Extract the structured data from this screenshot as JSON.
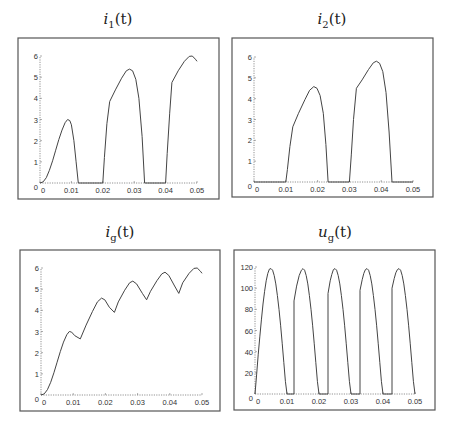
{
  "chart_data": [
    {
      "id": "i1",
      "type": "line",
      "title": "i1(t)",
      "title_base": "i",
      "title_sub": "1",
      "title_arg": "(t)",
      "xlabel": "",
      "ylabel": "",
      "xlim": [
        0,
        0.05
      ],
      "ylim": [
        0,
        6
      ],
      "xticks": [
        "0",
        "0.01",
        "0.02",
        "0.03",
        "0.04",
        "0.05"
      ],
      "yticks": [
        "0",
        "1",
        "2",
        "3",
        "4",
        "5",
        "6"
      ],
      "grid": false,
      "points": [
        [
          0,
          0
        ],
        [
          0.001,
          0.05
        ],
        [
          0.002,
          0.25
        ],
        [
          0.003,
          0.6
        ],
        [
          0.004,
          1.05
        ],
        [
          0.005,
          1.55
        ],
        [
          0.006,
          2.05
        ],
        [
          0.007,
          2.5
        ],
        [
          0.008,
          2.85
        ],
        [
          0.0088,
          3.0
        ],
        [
          0.0095,
          2.95
        ],
        [
          0.01,
          2.75
        ],
        [
          0.0108,
          2.0
        ],
        [
          0.0115,
          1.0
        ],
        [
          0.0122,
          0
        ],
        [
          0.02,
          0
        ],
        [
          0.0205,
          1.2
        ],
        [
          0.0213,
          2.8
        ],
        [
          0.0222,
          3.85
        ],
        [
          0.024,
          4.4
        ],
        [
          0.026,
          4.95
        ],
        [
          0.0275,
          5.3
        ],
        [
          0.0285,
          5.38
        ],
        [
          0.0295,
          5.3
        ],
        [
          0.0305,
          4.9
        ],
        [
          0.0315,
          4.0
        ],
        [
          0.0325,
          2.2
        ],
        [
          0.0333,
          0
        ],
        [
          0.04,
          0
        ],
        [
          0.0405,
          1.4
        ],
        [
          0.0413,
          3.3
        ],
        [
          0.042,
          4.75
        ],
        [
          0.044,
          5.3
        ],
        [
          0.046,
          5.75
        ],
        [
          0.0475,
          5.98
        ],
        [
          0.0485,
          6.0
        ],
        [
          0.0495,
          5.85
        ],
        [
          0.05,
          5.75
        ]
      ]
    },
    {
      "id": "i2",
      "type": "line",
      "title": "i2(t)",
      "title_base": "i",
      "title_sub": "2",
      "title_arg": "(t)",
      "xlabel": "",
      "ylabel": "",
      "xlim": [
        0,
        0.05
      ],
      "ylim": [
        0,
        6
      ],
      "xticks": [
        "0",
        "0.01",
        "0.02",
        "0.03",
        "0.04",
        "0.05"
      ],
      "yticks": [
        "0",
        "1",
        "2",
        "3",
        "4",
        "5",
        "6"
      ],
      "grid": false,
      "points": [
        [
          0,
          0
        ],
        [
          0.01,
          0
        ],
        [
          0.0105,
          0.6
        ],
        [
          0.0113,
          1.7
        ],
        [
          0.0122,
          2.65
        ],
        [
          0.014,
          3.3
        ],
        [
          0.016,
          3.95
        ],
        [
          0.0175,
          4.4
        ],
        [
          0.0188,
          4.58
        ],
        [
          0.0198,
          4.5
        ],
        [
          0.0208,
          4.15
        ],
        [
          0.0218,
          3.3
        ],
        [
          0.0226,
          1.8
        ],
        [
          0.0233,
          0
        ],
        [
          0.03,
          0
        ],
        [
          0.0306,
          1.3
        ],
        [
          0.0313,
          3.0
        ],
        [
          0.0322,
          4.5
        ],
        [
          0.034,
          4.9
        ],
        [
          0.036,
          5.4
        ],
        [
          0.0375,
          5.72
        ],
        [
          0.0385,
          5.8
        ],
        [
          0.0395,
          5.7
        ],
        [
          0.0405,
          5.3
        ],
        [
          0.0415,
          4.3
        ],
        [
          0.0425,
          2.4
        ],
        [
          0.0434,
          0
        ],
        [
          0.05,
          0
        ]
      ]
    },
    {
      "id": "ig",
      "type": "line",
      "title": "ig(t)",
      "title_base": "i",
      "title_sub": "g",
      "title_arg": "(t)",
      "xlabel": "",
      "ylabel": "",
      "xlim": [
        0,
        0.05
      ],
      "ylim": [
        0,
        6
      ],
      "xticks": [
        "0",
        "0.01",
        "0.02",
        "0.03",
        "0.04",
        "0.05"
      ],
      "yticks": [
        "0",
        "1",
        "2",
        "3",
        "4",
        "5",
        "6"
      ],
      "grid": false,
      "points": [
        [
          0,
          0
        ],
        [
          0.001,
          0.05
        ],
        [
          0.002,
          0.25
        ],
        [
          0.003,
          0.6
        ],
        [
          0.004,
          1.05
        ],
        [
          0.005,
          1.55
        ],
        [
          0.006,
          2.05
        ],
        [
          0.007,
          2.5
        ],
        [
          0.008,
          2.85
        ],
        [
          0.0088,
          3.0
        ],
        [
          0.0095,
          2.97
        ],
        [
          0.0105,
          2.8
        ],
        [
          0.0122,
          2.65
        ],
        [
          0.014,
          3.3
        ],
        [
          0.016,
          3.95
        ],
        [
          0.0175,
          4.4
        ],
        [
          0.0188,
          4.58
        ],
        [
          0.0198,
          4.5
        ],
        [
          0.0212,
          4.15
        ],
        [
          0.0228,
          3.9
        ],
        [
          0.024,
          4.4
        ],
        [
          0.026,
          4.95
        ],
        [
          0.0275,
          5.3
        ],
        [
          0.0285,
          5.38
        ],
        [
          0.0297,
          5.25
        ],
        [
          0.0315,
          4.8
        ],
        [
          0.0328,
          4.5
        ],
        [
          0.034,
          4.9
        ],
        [
          0.036,
          5.4
        ],
        [
          0.0375,
          5.72
        ],
        [
          0.0385,
          5.8
        ],
        [
          0.0397,
          5.65
        ],
        [
          0.0415,
          5.15
        ],
        [
          0.0428,
          4.8
        ],
        [
          0.044,
          5.3
        ],
        [
          0.046,
          5.75
        ],
        [
          0.0475,
          5.98
        ],
        [
          0.0485,
          6.0
        ],
        [
          0.0495,
          5.85
        ],
        [
          0.05,
          5.75
        ]
      ]
    },
    {
      "id": "ug",
      "type": "line",
      "title": "ug(t)",
      "title_base": "u",
      "title_sub": "g",
      "title_arg": "(t)",
      "xlabel": "",
      "ylabel": "",
      "xlim": [
        0,
        0.05
      ],
      "ylim": [
        0,
        120
      ],
      "xticks": [
        "0",
        "0.01",
        "0.02",
        "0.03",
        "0.04",
        "0.05"
      ],
      "yticks": [
        "0",
        "20",
        "40",
        "60",
        "80",
        "100",
        "120"
      ],
      "grid": false,
      "points": [
        [
          0,
          0
        ],
        [
          0.0005,
          18
        ],
        [
          0.001,
          37
        ],
        [
          0.0015,
          54
        ],
        [
          0.002,
          70
        ],
        [
          0.0025,
          85
        ],
        [
          0.003,
          97
        ],
        [
          0.0035,
          107
        ],
        [
          0.004,
          114
        ],
        [
          0.0045,
          118
        ],
        [
          0.005,
          118.5
        ],
        [
          0.0055,
          117
        ],
        [
          0.006,
          112
        ],
        [
          0.0065,
          104
        ],
        [
          0.007,
          93
        ],
        [
          0.0075,
          80
        ],
        [
          0.008,
          65
        ],
        [
          0.0085,
          48
        ],
        [
          0.009,
          30
        ],
        [
          0.0095,
          12
        ],
        [
          0.01,
          0
        ],
        [
          0.0122,
          0
        ],
        [
          0.0122,
          88
        ],
        [
          0.013,
          102
        ],
        [
          0.0138,
          112
        ],
        [
          0.0145,
          117
        ],
        [
          0.015,
          118.5
        ],
        [
          0.0155,
          117
        ],
        [
          0.016,
          112
        ],
        [
          0.0165,
          104
        ],
        [
          0.017,
          93
        ],
        [
          0.0175,
          80
        ],
        [
          0.018,
          65
        ],
        [
          0.0185,
          48
        ],
        [
          0.019,
          30
        ],
        [
          0.0195,
          12
        ],
        [
          0.02,
          0
        ],
        [
          0.0228,
          0
        ],
        [
          0.0228,
          95
        ],
        [
          0.0235,
          107
        ],
        [
          0.024,
          113
        ],
        [
          0.0245,
          117.5
        ],
        [
          0.025,
          118.5
        ],
        [
          0.0255,
          117
        ],
        [
          0.026,
          112
        ],
        [
          0.0265,
          104
        ],
        [
          0.027,
          93
        ],
        [
          0.0275,
          80
        ],
        [
          0.028,
          65
        ],
        [
          0.0285,
          48
        ],
        [
          0.029,
          30
        ],
        [
          0.0295,
          12
        ],
        [
          0.03,
          0
        ],
        [
          0.0328,
          0
        ],
        [
          0.0328,
          98
        ],
        [
          0.0335,
          108
        ],
        [
          0.034,
          114
        ],
        [
          0.0345,
          117.5
        ],
        [
          0.035,
          118.5
        ],
        [
          0.0355,
          117
        ],
        [
          0.036,
          112
        ],
        [
          0.0365,
          104
        ],
        [
          0.037,
          93
        ],
        [
          0.0375,
          80
        ],
        [
          0.038,
          65
        ],
        [
          0.0385,
          48
        ],
        [
          0.039,
          30
        ],
        [
          0.0395,
          12
        ],
        [
          0.04,
          0
        ],
        [
          0.0428,
          0
        ],
        [
          0.0428,
          100
        ],
        [
          0.0435,
          109
        ],
        [
          0.044,
          114.5
        ],
        [
          0.0445,
          117.5
        ],
        [
          0.045,
          118.5
        ],
        [
          0.0455,
          117
        ],
        [
          0.046,
          112
        ],
        [
          0.0465,
          104
        ],
        [
          0.047,
          93
        ],
        [
          0.0475,
          80
        ],
        [
          0.048,
          65
        ],
        [
          0.0485,
          48
        ],
        [
          0.049,
          30
        ],
        [
          0.0495,
          12
        ],
        [
          0.05,
          0
        ]
      ]
    }
  ],
  "layout": {
    "panels": [
      {
        "id": "i1",
        "frame": [
          18,
          38,
          201,
          161
        ],
        "origin": [
          40,
          183
        ],
        "x_end": 197,
        "y_top": 56,
        "title_center": [
          118,
          20
        ]
      },
      {
        "id": "i2",
        "frame": [
          232,
          38,
          201,
          159
        ],
        "origin": [
          254,
          182
        ],
        "x_end": 413,
        "y_top": 57,
        "title_center": [
          332,
          20
        ]
      },
      {
        "id": "ig",
        "frame": [
          20,
          250,
          200,
          161
        ],
        "origin": [
          41,
          395
        ],
        "x_end": 202,
        "y_top": 268,
        "title_center": [
          120,
          233
        ]
      },
      {
        "id": "ug",
        "frame": [
          234,
          250,
          201,
          160
        ],
        "origin": [
          255,
          394
        ],
        "x_end": 415,
        "y_top": 267,
        "title_center": [
          335,
          233
        ]
      }
    ]
  }
}
